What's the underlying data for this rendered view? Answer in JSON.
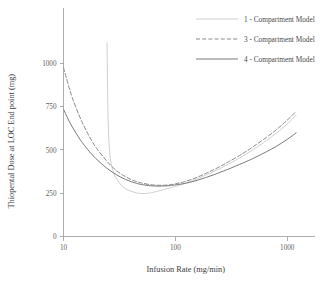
{
  "chart_data": {
    "type": "line",
    "title": "",
    "xlabel": "Infusion Rate (mg/min)",
    "ylabel": "Thiopental Dose at LOC End point (mg)",
    "xscale": "log",
    "yscale": "linear",
    "xlim": [
      10,
      1300
    ],
    "ylim": [
      0,
      1100
    ],
    "xticks": [
      10,
      100,
      1000
    ],
    "xtick_labels": [
      "10",
      "100",
      "1000"
    ],
    "yticks": [
      0,
      250,
      500,
      750,
      1000
    ],
    "ytick_labels": [
      "0",
      "250",
      "500",
      "750",
      "1000"
    ],
    "grid": false,
    "legend_position": "top-right",
    "series": [
      {
        "name": "1 - Compartment Model",
        "linestyle": "solid",
        "color": "#c9c9c9",
        "linewidth": 0.9,
        "x": [
          24.5,
          25,
          26,
          28,
          30,
          33,
          36,
          40,
          45,
          50,
          55,
          60,
          70,
          80,
          90,
          100,
          120,
          150,
          200,
          250,
          300,
          400,
          500,
          650,
          800,
          1000,
          1200
        ],
        "y": [
          1120,
          700,
          470,
          370,
          330,
          295,
          275,
          262,
          252,
          248,
          249,
          252,
          262,
          272,
          281,
          289,
          305,
          328,
          363,
          393,
          419,
          464,
          503,
          553,
          597,
          650,
          700
        ]
      },
      {
        "name": "3 - Compartment Model",
        "linestyle": "dashed",
        "color": "#7d7d7d",
        "linewidth": 0.9,
        "x": [
          10,
          11,
          12,
          14,
          16,
          18,
          20,
          24,
          28,
          32,
          36,
          40,
          45,
          50,
          60,
          70,
          80,
          90,
          100,
          120,
          150,
          200,
          250,
          300,
          400,
          500,
          650,
          800,
          1000,
          1200
        ],
        "y": [
          975,
          880,
          800,
          690,
          610,
          550,
          505,
          440,
          395,
          365,
          345,
          330,
          317,
          309,
          299,
          296,
          296,
          299,
          304,
          316,
          337,
          373,
          404,
          432,
          479,
          520,
          572,
          617,
          672,
          723
        ]
      },
      {
        "name": "4 - Compartment Model",
        "linestyle": "solid",
        "color": "#6b6b6b",
        "linewidth": 0.9,
        "x": [
          10,
          11,
          12,
          14,
          16,
          18,
          20,
          24,
          28,
          32,
          36,
          40,
          45,
          50,
          60,
          70,
          80,
          90,
          100,
          120,
          150,
          200,
          250,
          300,
          400,
          500,
          650,
          800,
          1000,
          1200
        ],
        "y": [
          735,
          678,
          632,
          562,
          512,
          473,
          443,
          398,
          367,
          345,
          329,
          317,
          307,
          300,
          293,
          291,
          292,
          294,
          298,
          306,
          321,
          347,
          370,
          390,
          424,
          452,
          489,
          521,
          561,
          598
        ]
      }
    ],
    "annotations": []
  },
  "legend": {
    "items": [
      {
        "label": "1 - Compartment Model"
      },
      {
        "label": "3 - Compartment Model"
      },
      {
        "label": "4 - Compartment Model"
      }
    ]
  }
}
